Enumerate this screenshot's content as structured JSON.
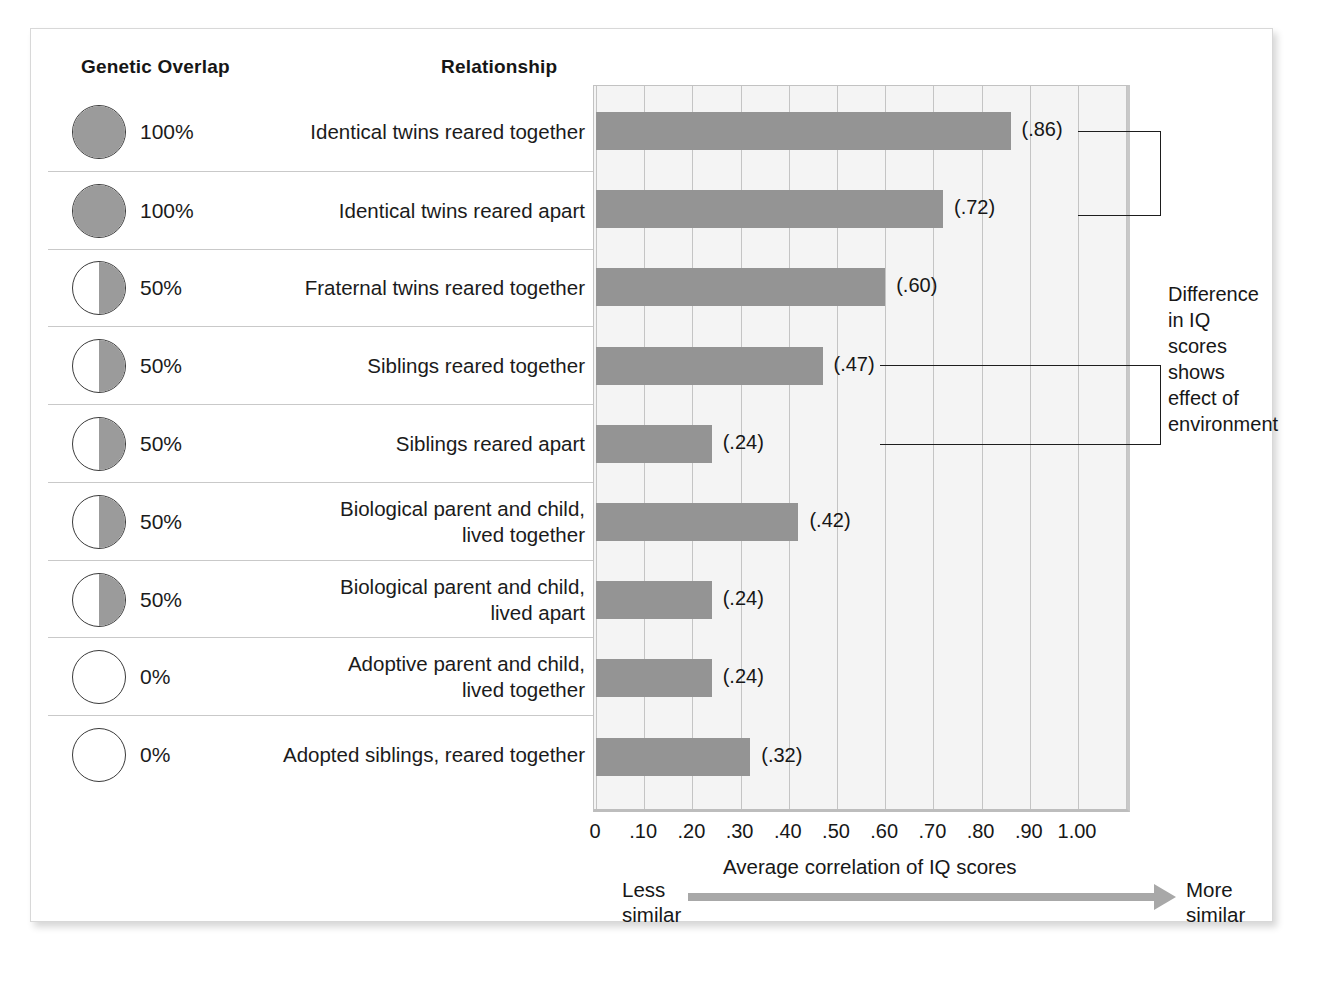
{
  "figure": {
    "headers": {
      "genetic_overlap": "Genetic Overlap",
      "relationship": "Relationship"
    },
    "annotation": "Difference\nin IQ\nscores\nshows\neffect of\nenvironment",
    "axis_caption": "Average correlation of IQ scores",
    "less_similar": "Less\nsimilar",
    "more_similar": "More\nsimilar",
    "arrow_icon": "right-arrow-icon",
    "colors": {
      "bar": "#949494",
      "circle_fill": "#9b9b9b",
      "plot_background": "#f4f4f4",
      "gridline": "#c4c4c4",
      "arrow": "#a8a8a8"
    }
  },
  "chart_data": {
    "type": "bar",
    "title": "",
    "xlabel": "Average correlation of IQ scores",
    "ylabel": "",
    "xlim": [
      0,
      1.0
    ],
    "grid": true,
    "orientation": "horizontal",
    "tick_labels": [
      "0",
      ".10",
      ".20",
      ".30",
      ".40",
      ".50",
      ".60",
      ".70",
      ".80",
      ".90",
      "1.00"
    ],
    "tick_values": [
      0,
      0.1,
      0.2,
      0.3,
      0.4,
      0.5,
      0.6,
      0.7,
      0.8,
      0.9,
      1.0
    ],
    "categories": [
      "Identical twins reared together",
      "Identical twins reared apart",
      "Fraternal twins reared together",
      "Siblings reared together",
      "Siblings reared apart",
      "Biological parent and child,\nlived together",
      "Biological parent and child,\nlived apart",
      "Adoptive parent and child,\nlived together",
      "Adopted siblings, reared together"
    ],
    "values": [
      0.86,
      0.72,
      0.6,
      0.47,
      0.24,
      0.42,
      0.24,
      0.24,
      0.32
    ],
    "value_labels": [
      "(.86)",
      "(.72)",
      "(.60)",
      "(.47)",
      "(.24)",
      "(.42)",
      "(.24)",
      "(.24)",
      "(.32)"
    ],
    "genetic_overlap": [
      "100%",
      "100%",
      "50%",
      "50%",
      "50%",
      "50%",
      "50%",
      "0%",
      "0%"
    ],
    "genetic_overlap_fraction": [
      1.0,
      1.0,
      0.5,
      0.5,
      0.5,
      0.5,
      0.5,
      0.0,
      0.0
    ]
  },
  "rows": [
    {
      "pct": "100%",
      "fill": "full",
      "label": "Identical twins reared together",
      "value": 0.86,
      "value_label": "(.86)"
    },
    {
      "pct": "100%",
      "fill": "full",
      "label": "Identical twins reared apart",
      "value": 0.72,
      "value_label": "(.72)"
    },
    {
      "pct": "50%",
      "fill": "half",
      "label": "Fraternal twins reared together",
      "value": 0.6,
      "value_label": "(.60)"
    },
    {
      "pct": "50%",
      "fill": "half",
      "label": "Siblings reared together",
      "value": 0.47,
      "value_label": "(.47)"
    },
    {
      "pct": "50%",
      "fill": "half",
      "label": "Siblings reared apart",
      "value": 0.24,
      "value_label": "(.24)"
    },
    {
      "pct": "50%",
      "fill": "half",
      "label": "Biological parent and child,\nlived together",
      "value": 0.42,
      "value_label": "(.42)"
    },
    {
      "pct": "50%",
      "fill": "half",
      "label": "Biological parent and child,\nlived apart",
      "value": 0.24,
      "value_label": "(.24)"
    },
    {
      "pct": "0%",
      "fill": "none",
      "label": "Adoptive parent and child,\nlived together",
      "value": 0.24,
      "value_label": "(.24)"
    },
    {
      "pct": "0%",
      "fill": "none",
      "label": "Adopted siblings, reared together",
      "value": 0.32,
      "value_label": "(.32)"
    }
  ]
}
